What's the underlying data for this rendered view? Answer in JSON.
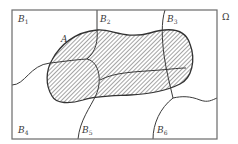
{
  "diagram": {
    "universe_label": "Ω",
    "event_label": "A",
    "partition": [
      {
        "name": "B",
        "index": "1"
      },
      {
        "name": "B",
        "index": "2"
      },
      {
        "name": "B",
        "index": "3"
      },
      {
        "name": "B",
        "index": "4"
      },
      {
        "name": "B",
        "index": "5"
      },
      {
        "name": "B",
        "index": "6"
      }
    ],
    "colors": {
      "stroke": "#3a3a3a",
      "frame": "#6a6a6a",
      "hatch": "#4a4a4a",
      "background": "#ffffff"
    }
  }
}
